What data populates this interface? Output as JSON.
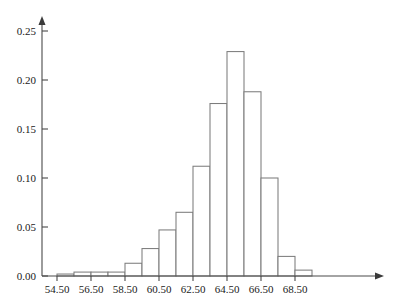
{
  "chart_data": {
    "type": "bar",
    "title": "",
    "subtitle": "",
    "xlabel": "",
    "ylabel": "",
    "grid": false,
    "legend": false,
    "legend_position": "none",
    "bin_width": 1,
    "bin_edges": [
      54.5,
      55.5,
      56.5,
      57.5,
      58.5,
      59.5,
      60.5,
      61.5,
      62.5,
      63.5,
      64.5,
      65.5,
      66.5,
      67.5,
      68.5,
      69.5
    ],
    "categories": [
      "54.50-55.50",
      "55.50-56.50",
      "56.50-57.50",
      "57.50-58.50",
      "58.50-59.50",
      "59.50-60.50",
      "60.50-61.50",
      "61.50-62.50",
      "62.50-63.50",
      "63.50-64.50",
      "64.50-65.50",
      "65.50-66.50",
      "66.50-67.50",
      "67.50-68.50",
      "68.50-69.50"
    ],
    "values": [
      0.002,
      0.004,
      0.004,
      0.004,
      0.013,
      0.028,
      0.047,
      0.065,
      0.112,
      0.176,
      0.229,
      0.188,
      0.1,
      0.02,
      0.006
    ],
    "xlim": [
      54.5,
      70.2
    ],
    "ylim": [
      0,
      0.262
    ],
    "x_ticks": [
      54.5,
      56.5,
      58.5,
      60.5,
      62.5,
      64.5,
      66.5,
      68.5
    ],
    "x_tick_labels": [
      "54.50",
      "56.50",
      "58.50",
      "60.50",
      "62.50",
      "64.50",
      "66.50",
      "68.50"
    ],
    "y_ticks": [
      0.0,
      0.05,
      0.1,
      0.15,
      0.2,
      0.25
    ],
    "y_tick_labels": [
      "0.00",
      "0.05",
      "0.10",
      "0.15",
      "0.20",
      "0.25"
    ],
    "axis_color": "#4a4a4a",
    "bar_stroke_color": "#7d7d7d",
    "bar_fill_color": "#ffffff",
    "background_color": "#ffffff"
  }
}
